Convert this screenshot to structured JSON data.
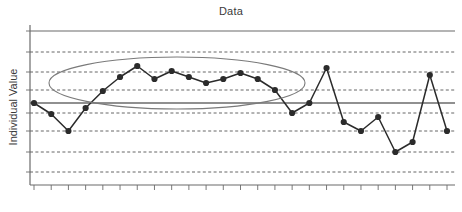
{
  "chart_data": {
    "type": "line",
    "title": "Data",
    "xlabel": "",
    "ylabel": "Individual Value",
    "grid": true,
    "legend": false,
    "x": [
      1,
      2,
      3,
      4,
      5,
      6,
      7,
      8,
      9,
      10,
      11,
      12,
      13,
      14,
      15,
      16,
      17,
      18,
      19,
      20,
      21,
      22,
      23,
      24,
      25
    ],
    "values": [
      103,
      114,
      131,
      108,
      91,
      77,
      66,
      79,
      71,
      77,
      83,
      79,
      73,
      79,
      90,
      113,
      103,
      68,
      122,
      131,
      117,
      152,
      142,
      75,
      131
    ],
    "series": [
      {
        "name": "Individual Value",
        "values": [
          103,
          114,
          131,
          108,
          91,
          77,
          66,
          79,
          71,
          77,
          83,
          79,
          73,
          79,
          90,
          113,
          103,
          68,
          122,
          131,
          117,
          152,
          142,
          75,
          131
        ]
      }
    ],
    "ylim": [
      185,
      31
    ],
    "axis_lines": {
      "ucl_label": "UCL",
      "ucl_y": 31,
      "center_label": "Mean",
      "center_y": 103
    },
    "gridline_positions": [
      52,
      72,
      90,
      113,
      131,
      152,
      172
    ],
    "tick_count": 25,
    "annotation": {
      "type": "ellipse",
      "label": "highlighted-run-ellipse",
      "cx": 177,
      "cy": 83,
      "rx": 128,
      "ry": 26
    },
    "colors": {
      "line": "#2b2b2b",
      "marker": "#2b2b2b",
      "grid": "#555555",
      "axis": "#6b6b6b",
      "center_line": "#6b6b6b",
      "ellipse": "#7a7a7a",
      "text": "#3a3a3a",
      "background": "#ffffff"
    }
  }
}
